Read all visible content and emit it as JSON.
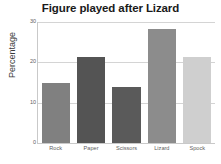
{
  "chart_data": {
    "type": "bar",
    "title": "Figure played after Lizard",
    "xlabel": "",
    "ylabel": "Percentage",
    "categories": [
      "Rock",
      "Paper",
      "Scissors",
      "Lizard",
      "Spock"
    ],
    "values": [
      15,
      21.3,
      13.9,
      28.3,
      21.3
    ],
    "yticks": [
      0,
      10,
      20,
      30
    ],
    "ytick_labels": [
      "0",
      "10",
      "20",
      "30"
    ],
    "ylim": [
      0,
      30
    ],
    "grid": true,
    "legend": "none",
    "bar_colors": [
      "#808080",
      "#545454",
      "#5a5a5a",
      "#8c8c8c",
      "#cfcfcf"
    ],
    "grid_color": "#d4d4d4",
    "axis_color": "#c9c9c9",
    "title_color": "#1a1a1a",
    "tick_label_color": "#5e5e5e",
    "background": "#ffffff"
  }
}
